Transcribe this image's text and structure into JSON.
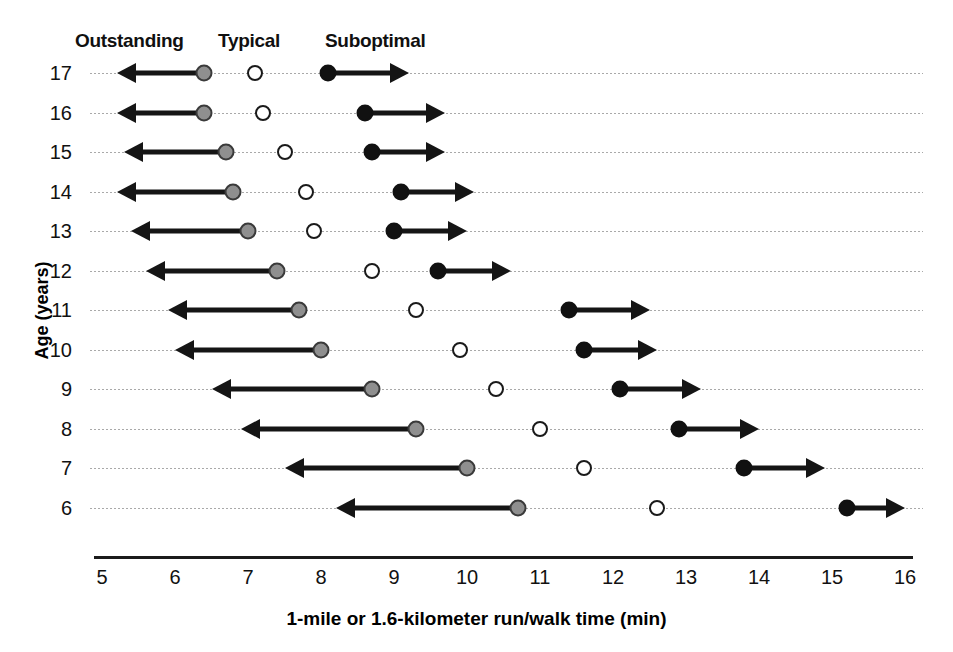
{
  "legend": {
    "outstanding": "Outstanding",
    "typical": "Typical",
    "suboptimal": "Suboptimal"
  },
  "axes": {
    "y_title": "Age (years)",
    "x_title": "1-mile or 1.6-kilometer run/walk time (min)",
    "x_ticks": [
      "5",
      "6",
      "7",
      "8",
      "9",
      "10",
      "11",
      "12",
      "13",
      "14",
      "15",
      "16"
    ],
    "y_ticks": [
      "17",
      "16",
      "15",
      "14",
      "13",
      "12",
      "11",
      "10",
      "9",
      "8",
      "7",
      "6"
    ]
  },
  "colors": {
    "outstanding_marker": "#8f8f8f",
    "typical_marker": "#ffffff",
    "suboptimal_marker": "#111111",
    "arrow": "#151515",
    "gridline": "#9a9a9a",
    "axis": "#1b1b1b",
    "text": "#111111"
  },
  "chart_data": {
    "type": "scatter",
    "title": "",
    "subtitle": "",
    "xlabel": "1-mile or 1.6-kilometer run/walk time (min)",
    "ylabel": "Age (years)",
    "xlim": [
      5,
      16
    ],
    "ylim": [
      6,
      17
    ],
    "grid": true,
    "legend_position": "top",
    "legend_entries": [
      "Outstanding",
      "Typical",
      "Suboptimal"
    ],
    "annotations": [
      "Leftward arrow from Outstanding marker indicates faster (better) times",
      "Rightward arrow from Suboptimal marker indicates slower times"
    ],
    "categories": [
      17,
      16,
      15,
      14,
      13,
      12,
      11,
      10,
      9,
      8,
      7,
      6
    ],
    "series": [
      {
        "name": "Outstanding",
        "marker": "grey-filled-circle",
        "arrow": "left",
        "values": [
          6.4,
          6.4,
          6.7,
          6.8,
          7.0,
          7.4,
          7.7,
          8.0,
          8.7,
          9.3,
          10.0,
          10.7
        ]
      },
      {
        "name": "Typical",
        "marker": "open-circle",
        "arrow": "none",
        "values": [
          7.1,
          7.2,
          7.5,
          7.8,
          7.9,
          8.7,
          9.3,
          9.9,
          10.4,
          11.0,
          11.6,
          12.6
        ]
      },
      {
        "name": "Suboptimal",
        "marker": "black-filled-circle",
        "arrow": "right",
        "values": [
          8.1,
          8.6,
          8.7,
          9.1,
          9.0,
          9.6,
          11.4,
          11.6,
          12.1,
          12.9,
          13.8,
          15.2
        ]
      }
    ],
    "arrow_extents": {
      "Outstanding": [
        5.2,
        5.2,
        5.3,
        5.2,
        5.4,
        5.6,
        5.9,
        6.0,
        6.5,
        6.9,
        7.5,
        8.2
      ],
      "Suboptimal": [
        9.2,
        9.7,
        9.7,
        10.1,
        10.0,
        10.6,
        12.5,
        12.6,
        13.2,
        14.0,
        14.9,
        16.0
      ]
    }
  }
}
